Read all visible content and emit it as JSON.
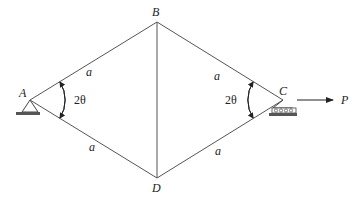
{
  "diagram": {
    "type": "truss",
    "nodes": {
      "A": {
        "label": "A",
        "x": 30,
        "y": 100
      },
      "B": {
        "label": "B",
        "x": 157,
        "y": 22
      },
      "C": {
        "label": "C",
        "x": 283,
        "y": 100
      },
      "D": {
        "label": "D",
        "x": 157,
        "y": 178
      }
    },
    "members": [
      {
        "from": "A",
        "to": "B",
        "label": "a"
      },
      {
        "from": "B",
        "to": "C",
        "label": "a"
      },
      {
        "from": "A",
        "to": "D",
        "label": "a"
      },
      {
        "from": "D",
        "to": "C",
        "label": "a"
      },
      {
        "from": "B",
        "to": "D",
        "label": ""
      }
    ],
    "angles": {
      "A": "2θ",
      "C": "2θ"
    },
    "supports": {
      "A": "pin",
      "C": "roller"
    },
    "load": {
      "node": "C",
      "label": "P",
      "direction": "right"
    }
  }
}
